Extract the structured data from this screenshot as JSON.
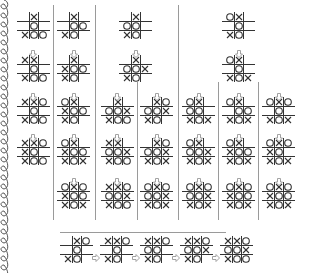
{
  "colors": {
    "line": "#333333",
    "divider": "#9a9a9a",
    "arrow": "#999999",
    "mark": "#333333"
  },
  "columns": [
    {
      "id": "col1",
      "x": 20,
      "boards": [
        {
          "y": 12,
          "cells": [
            "",
            "X",
            "",
            "",
            "O",
            "",
            "X",
            "O",
            "O"
          ]
        },
        {
          "y": 55,
          "cells": [
            "X",
            "X",
            "",
            "",
            "O",
            "",
            "X",
            "O",
            "O"
          ]
        },
        {
          "y": 97,
          "cells": [
            "X",
            "X",
            "O",
            "",
            "O",
            "",
            "X",
            "O",
            "O"
          ]
        },
        {
          "y": 138,
          "cells": [
            "X",
            "X",
            "O",
            "X",
            "O",
            "",
            "X",
            "O",
            "O"
          ]
        }
      ]
    },
    {
      "id": "col2",
      "x": 60,
      "boards": [
        {
          "y": 12,
          "cells": [
            "",
            "X",
            "",
            "",
            "O",
            "O",
            "X",
            "O",
            ""
          ]
        },
        {
          "y": 55,
          "cells": [
            "",
            "X",
            "",
            "X",
            "O",
            "O",
            "X",
            "O",
            ""
          ]
        },
        {
          "y": 97,
          "cells": [
            "O",
            "X",
            "",
            "X",
            "O",
            "O",
            "X",
            "O",
            ""
          ]
        },
        {
          "y": 138,
          "cells": [
            "O",
            "X",
            "",
            "X",
            "O",
            "O",
            "X",
            "O",
            "X"
          ]
        },
        {
          "y": 182,
          "cells": [
            "O",
            "X",
            "O",
            "X",
            "O",
            "O",
            "X",
            "O",
            "X"
          ]
        }
      ]
    },
    {
      "id": "col3-root",
      "x": 122,
      "boards": [
        {
          "y": 12,
          "cells": [
            "",
            "X",
            "",
            "O",
            "O",
            "",
            "X",
            "O",
            ""
          ]
        },
        {
          "y": 55,
          "cells": [
            "",
            "X",
            "",
            "O",
            "O",
            "X",
            "X",
            "O",
            ""
          ]
        }
      ]
    },
    {
      "id": "col3a",
      "x": 104,
      "boards": [
        {
          "y": 97,
          "cells": [
            "",
            "X",
            "",
            "O",
            "O",
            "X",
            "X",
            "O",
            "O"
          ]
        },
        {
          "y": 138,
          "cells": [
            "X",
            "X",
            "",
            "O",
            "O",
            "X",
            "X",
            "O",
            "O"
          ]
        },
        {
          "y": 182,
          "cells": [
            "X",
            "X",
            "O",
            "O",
            "O",
            "X",
            "X",
            "O",
            "O"
          ]
        }
      ]
    },
    {
      "id": "col3b",
      "x": 143,
      "boards": [
        {
          "y": 97,
          "cells": [
            "",
            "X",
            "O",
            "O",
            "O",
            "X",
            "X",
            "O",
            ""
          ]
        },
        {
          "y": 138,
          "cells": [
            "",
            "X",
            "O",
            "O",
            "O",
            "X",
            "X",
            "O",
            "X"
          ]
        },
        {
          "y": 182,
          "cells": [
            "O",
            "X",
            "O",
            "O",
            "O",
            "X",
            "X",
            "O",
            "X"
          ]
        }
      ]
    },
    {
      "id": "col4-root",
      "x": 225,
      "boards": [
        {
          "y": 12,
          "cells": [
            "O",
            "X",
            "",
            "",
            "O",
            "",
            "X",
            "O",
            ""
          ]
        },
        {
          "y": 55,
          "cells": [
            "O",
            "X",
            "",
            "",
            "O",
            "",
            "X",
            "O",
            "X"
          ]
        }
      ]
    },
    {
      "id": "col4a",
      "x": 185,
      "boards": [
        {
          "y": 97,
          "cells": [
            "O",
            "X",
            "",
            "O",
            "O",
            "",
            "X",
            "O",
            "X"
          ]
        },
        {
          "y": 138,
          "cells": [
            "O",
            "X",
            "",
            "O",
            "O",
            "X",
            "X",
            "O",
            "X"
          ]
        },
        {
          "y": 182,
          "cells": [
            "O",
            "X",
            "O",
            "O",
            "O",
            "X",
            "X",
            "O",
            "X"
          ]
        }
      ]
    },
    {
      "id": "col4b",
      "x": 225,
      "boards": [
        {
          "y": 97,
          "cells": [
            "O",
            "X",
            "",
            "",
            "O",
            "O",
            "X",
            "O",
            "X"
          ]
        },
        {
          "y": 138,
          "cells": [
            "O",
            "X",
            "",
            "X",
            "O",
            "O",
            "X",
            "O",
            "X"
          ]
        },
        {
          "y": 182,
          "cells": [
            "O",
            "X",
            "O",
            "X",
            "O",
            "O",
            "X",
            "O",
            "X"
          ]
        }
      ]
    },
    {
      "id": "col4c",
      "x": 265,
      "boards": [
        {
          "y": 97,
          "cells": [
            "O",
            "X",
            "O",
            "",
            "O",
            "",
            "X",
            "O",
            "X"
          ]
        },
        {
          "y": 138,
          "cells": [
            "O",
            "X",
            "O",
            "X",
            "O",
            "",
            "X",
            "O",
            "X"
          ]
        },
        {
          "y": 182,
          "cells": [
            "O",
            "X",
            "O",
            "X",
            "O",
            "O",
            "X",
            "O",
            "X"
          ]
        }
      ]
    }
  ],
  "bottom_sequence": {
    "y": 236,
    "xs": [
      63,
      103,
      143,
      183,
      223
    ],
    "boards": [
      {
        "cells": [
          "",
          "X",
          "O",
          "",
          "O",
          "",
          "X",
          "O",
          ""
        ]
      },
      {
        "cells": [
          "X",
          "X",
          "O",
          "",
          "O",
          "",
          "X",
          "O",
          ""
        ]
      },
      {
        "cells": [
          "X",
          "X",
          "O",
          "O",
          "O",
          "",
          "X",
          "O",
          ""
        ]
      },
      {
        "cells": [
          "X",
          "X",
          "O",
          "O",
          "O",
          "X",
          "X",
          "O",
          ""
        ]
      },
      {
        "cells": [
          "X",
          "X",
          "O",
          "O",
          "O",
          "X",
          "X",
          "O",
          "O"
        ]
      }
    ]
  },
  "down_arrows": [
    [
      29,
      43
    ],
    [
      29,
      86
    ],
    [
      29,
      127
    ],
    [
      70,
      43
    ],
    [
      70,
      86
    ],
    [
      70,
      127
    ],
    [
      70,
      171
    ],
    [
      132,
      43
    ],
    [
      113,
      86
    ],
    [
      113,
      127
    ],
    [
      113,
      171
    ],
    [
      153,
      86
    ],
    [
      153,
      127
    ],
    [
      153,
      171
    ],
    [
      235,
      43
    ],
    [
      195,
      86
    ],
    [
      195,
      127
    ],
    [
      195,
      171
    ],
    [
      235,
      86
    ],
    [
      235,
      127
    ],
    [
      235,
      171
    ],
    [
      275,
      86
    ],
    [
      275,
      127
    ],
    [
      275,
      171
    ]
  ],
  "right_arrows": [
    [
      92,
      247
    ],
    [
      132,
      247
    ],
    [
      172,
      247
    ],
    [
      212,
      247
    ]
  ],
  "vdividers": [
    [
      53,
      5,
      220
    ],
    [
      95,
      5,
      220
    ],
    [
      137,
      82,
      220
    ],
    [
      178,
      5,
      220
    ],
    [
      218,
      82,
      220
    ],
    [
      258,
      82,
      220
    ]
  ],
  "hdividers": [
    [
      60,
      226,
      232
    ]
  ]
}
